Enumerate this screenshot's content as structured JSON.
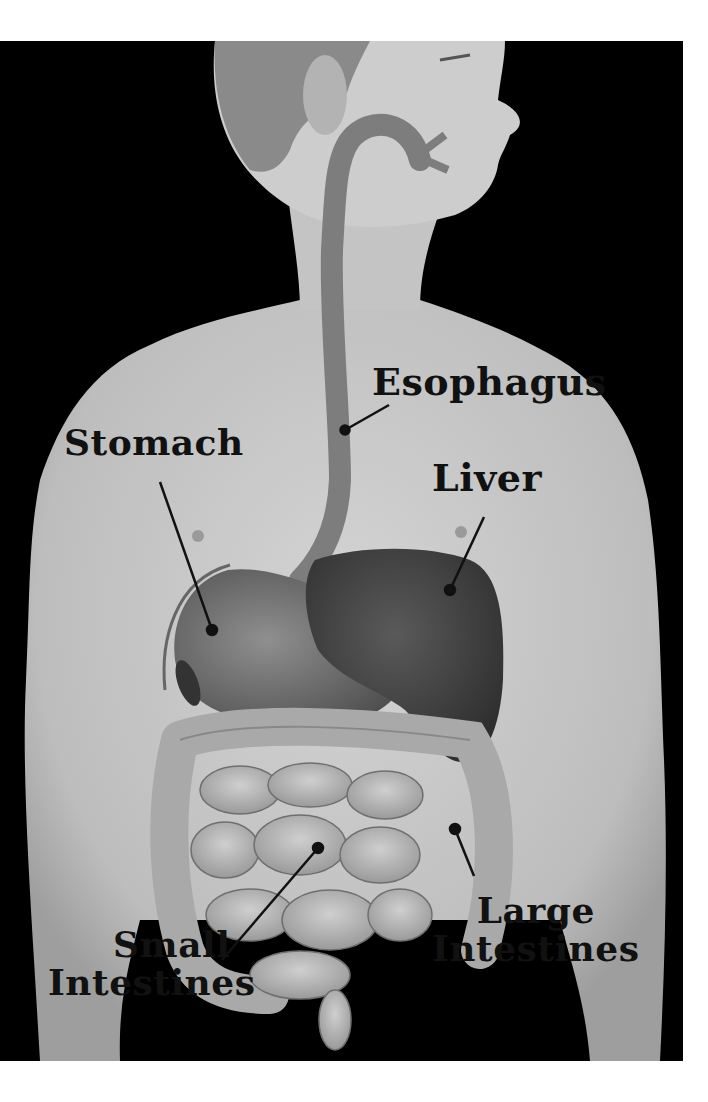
{
  "diagram": {
    "colors": {
      "background": "#000000",
      "page": "#ffffff",
      "skin": "#c9c9c9",
      "skin_shadow": "#a8a8a8",
      "organ_dark": "#4a4a4a",
      "organ_mid": "#7a7a7a",
      "intestine": "#b5b5b5",
      "label_text": "#111111"
    },
    "labels": [
      {
        "id": "esophagus",
        "text": "Esophagus",
        "pointer_dot": [
          345,
          430
        ]
      },
      {
        "id": "stomach",
        "text": "Stomach",
        "pointer_dot": [
          212,
          630
        ]
      },
      {
        "id": "liver",
        "text": "Liver",
        "pointer_dot": [
          450,
          590
        ]
      },
      {
        "id": "small-intestines",
        "line1": "Small",
        "line2": "Intestines",
        "pointer_dot": [
          318,
          848
        ]
      },
      {
        "id": "large-intestines",
        "line1": "Large",
        "line2": "Intestines",
        "pointer_dot": [
          455,
          829
        ]
      }
    ]
  }
}
